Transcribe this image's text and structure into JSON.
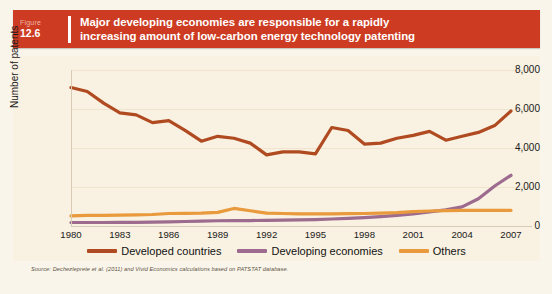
{
  "figure": {
    "label_word": "Figure",
    "number": "12.6",
    "title": "Major developing economies are responsible for a rapidly increasing amount of low-carbon energy technology patenting",
    "title_line1": "Major developing economies are responsible for a rapidly",
    "title_line2": "increasing amount of low-carbon energy technology patenting"
  },
  "source": {
    "text": "Source: Dechezleprete et al. (2011) and Vivid Economics calculations based on PATSTAT database."
  },
  "colors": {
    "header_bar": "#cc3b22",
    "panel_background": "#f9f1e1",
    "page_background": "#faf5ea",
    "developed": "#b04a20",
    "developing": "#9c6b8e",
    "others": "#e89a3c"
  },
  "chart_data": {
    "type": "line",
    "title": "Major developing economies are responsible for a rapidly increasing amount of low-carbon energy technology patenting",
    "xlabel": "",
    "ylabel": "Number of patents",
    "xlim": [
      1980,
      2007
    ],
    "ylim": [
      0,
      8000
    ],
    "yticks": [
      0,
      2000,
      4000,
      6000,
      8000
    ],
    "ytick_labels": [
      "0",
      "2,000",
      "4,000",
      "6,000",
      "8,000"
    ],
    "xticks": [
      1980,
      1983,
      1986,
      1989,
      1992,
      1995,
      1998,
      2001,
      2004,
      2007
    ],
    "xtick_labels": [
      "1980",
      "1983",
      "1986",
      "1989",
      "1992",
      "1995",
      "1998",
      "2001",
      "2004",
      "2007"
    ],
    "grid": true,
    "legend_position": "bottom",
    "x": [
      1980,
      1981,
      1982,
      1983,
      1984,
      1985,
      1986,
      1987,
      1988,
      1989,
      1990,
      1991,
      1992,
      1993,
      1994,
      1995,
      1996,
      1997,
      1998,
      1999,
      2000,
      2001,
      2002,
      2003,
      2004,
      2005,
      2006,
      2007
    ],
    "series": [
      {
        "name": "Developed countries",
        "color": "#b04a20",
        "values": [
          7100,
          6900,
          6300,
          5800,
          5700,
          5300,
          5400,
          4900,
          4350,
          4600,
          4500,
          4250,
          3650,
          3800,
          3800,
          3700,
          5050,
          4900,
          4200,
          4250,
          4500,
          4650,
          4850,
          4400,
          4600,
          4800,
          5150,
          5900
        ]
      },
      {
        "name": "Developing economies",
        "color": "#9c6b8e",
        "values": [
          180,
          180,
          180,
          190,
          190,
          200,
          210,
          230,
          250,
          270,
          280,
          280,
          290,
          300,
          310,
          330,
          360,
          390,
          430,
          480,
          540,
          620,
          720,
          830,
          980,
          1400,
          2050,
          2600
        ]
      },
      {
        "name": "Others",
        "color": "#e89a3c",
        "values": [
          520,
          540,
          540,
          560,
          570,
          590,
          640,
          650,
          660,
          700,
          900,
          780,
          660,
          640,
          620,
          620,
          620,
          630,
          640,
          660,
          690,
          740,
          770,
          790,
          800,
          800,
          800,
          800
        ]
      }
    ]
  }
}
